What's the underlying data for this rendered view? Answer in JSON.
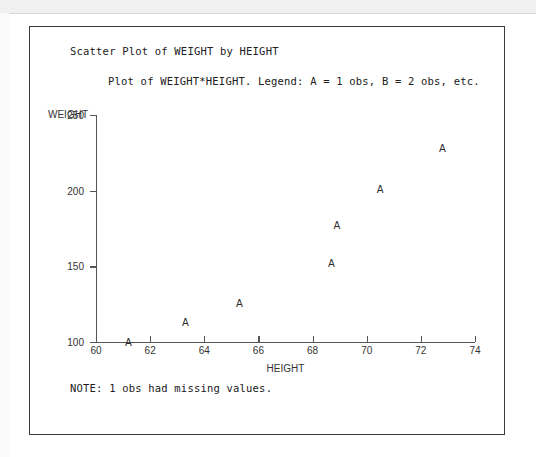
{
  "report": {
    "title": "Scatter Plot of WEIGHT by HEIGHT",
    "subtitle": "Plot of WEIGHT*HEIGHT.  Legend: A = 1 obs, B = 2 obs, etc.",
    "footer_note": "NOTE: 1 obs had missing values."
  },
  "chart_data": {
    "type": "scatter",
    "title": "Scatter Plot of WEIGHT by HEIGHT",
    "subtitle": "Plot of WEIGHT*HEIGHT.  Legend: A = 1 obs, B = 2 obs, etc.",
    "xlabel": "HEIGHT",
    "ylabel": "WEIGHT",
    "xlim": [
      60,
      74
    ],
    "ylim": [
      100,
      250
    ],
    "xticks": [
      60,
      62,
      64,
      66,
      68,
      70,
      72,
      74
    ],
    "yticks": [
      100,
      150,
      200,
      250
    ],
    "grid": false,
    "legend": "A = 1 obs, B = 2 obs, etc.",
    "marker_symbol": "A",
    "points": [
      {
        "x": 61.2,
        "y": 100,
        "label": "A"
      },
      {
        "x": 63.3,
        "y": 113,
        "label": "A"
      },
      {
        "x": 65.3,
        "y": 126,
        "label": "A"
      },
      {
        "x": 68.7,
        "y": 152,
        "label": "A"
      },
      {
        "x": 68.9,
        "y": 177,
        "label": "A"
      },
      {
        "x": 70.5,
        "y": 201,
        "label": "A"
      },
      {
        "x": 72.8,
        "y": 228,
        "label": "A"
      }
    ]
  },
  "colors": {
    "axis": "#555555",
    "text": "#202020",
    "marker": "#2b2b2b",
    "frame": "#3a3a3a"
  }
}
